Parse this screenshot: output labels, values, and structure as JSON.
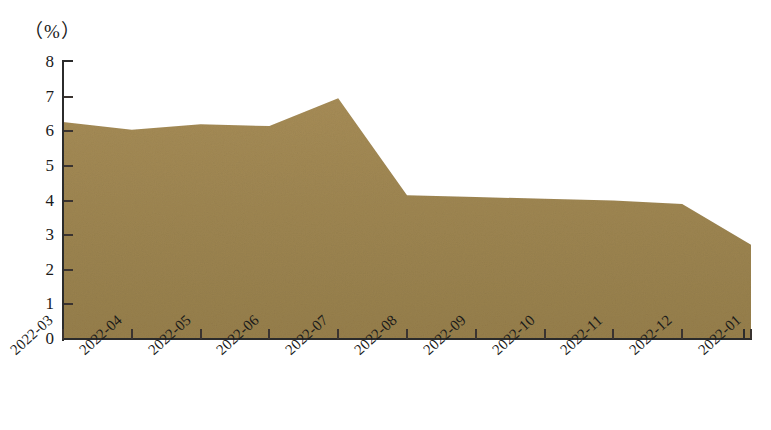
{
  "chart_data": {
    "type": "area",
    "title": "",
    "subtitle": "",
    "xlabel": "",
    "ylabel": "",
    "unit_label": "（%）",
    "categories": [
      "2022-03",
      "2022-04",
      "2022-05",
      "2022-06",
      "2022-07",
      "2022-08",
      "2022-09",
      "2022-10",
      "2022-11",
      "2022-12",
      "2022-01"
    ],
    "values": [
      6.27,
      6.04,
      6.2,
      6.15,
      6.95,
      4.15,
      4.1,
      4.05,
      4.0,
      3.9,
      2.72
    ],
    "ylim": [
      0,
      8
    ],
    "ytick_labels": [
      "0",
      "1",
      "2",
      "3",
      "4",
      "5",
      "6",
      "7",
      "8"
    ],
    "ytick_values": [
      0,
      1,
      2,
      3,
      4,
      5,
      6,
      7,
      8
    ],
    "grid": false,
    "legend": false,
    "legend_position": "none",
    "series": [
      {
        "name": "",
        "values": [
          6.27,
          6.04,
          6.2,
          6.15,
          6.95,
          4.15,
          4.1,
          4.05,
          4.0,
          3.9,
          2.72
        ]
      }
    ],
    "colors": {
      "area_fill": "#9c8450",
      "area_fill_light": "#a88e58",
      "axis": "#2b2b2b",
      "text": "#1a1a1a",
      "background": "#ffffff"
    },
    "xtick_label_rotation": -42
  }
}
